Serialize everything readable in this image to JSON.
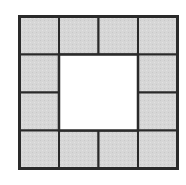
{
  "diagram": {
    "grid": {
      "rows": 4,
      "cols": 4
    },
    "origin": {
      "x": 19.5,
      "y": 16.5
    },
    "cell_width": 39.5,
    "cell_height": 38,
    "tile_fill": "#d6d6d6",
    "hole_fill": "#ffffff",
    "stroke": "#2a2a2a",
    "tiles": [
      {
        "row": 0,
        "col": 0
      },
      {
        "row": 0,
        "col": 1
      },
      {
        "row": 0,
        "col": 2
      },
      {
        "row": 0,
        "col": 3
      },
      {
        "row": 1,
        "col": 0
      },
      {
        "row": 1,
        "col": 3
      },
      {
        "row": 2,
        "col": 0
      },
      {
        "row": 2,
        "col": 3
      },
      {
        "row": 3,
        "col": 0
      },
      {
        "row": 3,
        "col": 1
      },
      {
        "row": 3,
        "col": 2
      },
      {
        "row": 3,
        "col": 3
      }
    ],
    "hole": {
      "row": 1,
      "col": 1,
      "rows": 2,
      "cols": 2
    }
  }
}
